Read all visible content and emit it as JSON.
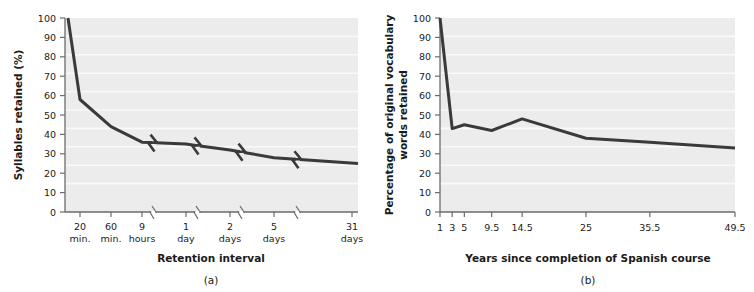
{
  "figure": {
    "background_color": "#ffffff",
    "plot_background_color": "#ececec",
    "gridline_color": "#f7f7f7",
    "line_color": "#3a3a3a",
    "axis_color": "#5a5a5a",
    "text_color": "#1a1a1a"
  },
  "panels": [
    {
      "id": "a",
      "caption": "(a)",
      "xlabel": "Retention interval",
      "ylabel": "Syllables retained (%)",
      "ytick_labels": [
        "0",
        "10",
        "20",
        "30",
        "40",
        "50",
        "60",
        "70",
        "80",
        "90",
        "100"
      ],
      "xtick_labels": [
        {
          "line1": "20",
          "line2": "min."
        },
        {
          "line1": "60",
          "line2": "min."
        },
        {
          "line1": "9",
          "line2": "hours"
        },
        {
          "line1": "1",
          "line2": "day"
        },
        {
          "line1": "2",
          "line2": "days"
        },
        {
          "line1": "5",
          "line2": "days"
        },
        {
          "line1": "31",
          "line2": "days"
        }
      ]
    },
    {
      "id": "b",
      "caption": "(b)",
      "xlabel": "Years since completion of Spanish course",
      "ylabel_line1": "Percentage of original vocabulary",
      "ylabel_line2": "words retained",
      "ytick_labels": [
        "0",
        "10",
        "20",
        "30",
        "40",
        "50",
        "60",
        "70",
        "80",
        "90",
        "100"
      ],
      "xtick_labels": [
        "1",
        "3",
        "5",
        "9.5",
        "14.5",
        "25",
        "35.5",
        "49.5"
      ]
    }
  ],
  "chart_data": [
    {
      "type": "line",
      "panel": "a",
      "title": "",
      "xlabel": "Retention interval",
      "ylabel": "Syllables retained (%)",
      "ylim": [
        0,
        100
      ],
      "ytick_values": [
        0,
        10,
        20,
        30,
        40,
        50,
        60,
        70,
        80,
        90,
        100
      ],
      "grid": true,
      "legend": "none",
      "x_is_categorical_with_breaks": true,
      "axis_breaks_after_categories": [
        "9 hours",
        "1 day",
        "2 days",
        "5 days"
      ],
      "categories": [
        "0 min.",
        "20 min.",
        "60 min.",
        "9 hours",
        "1 day",
        "2 days",
        "5 days",
        "31 days"
      ],
      "values": [
        100,
        58,
        44,
        36,
        35,
        32,
        28,
        25
      ],
      "annotations": "Ebbinghaus forgetting curve for nonsense syllables; axis and data line contain zig-zag break marks between time segments."
    },
    {
      "type": "line",
      "panel": "b",
      "title": "",
      "xlabel": "Years since completion of Spanish course",
      "ylabel": "Percentage of original vocabulary words retained",
      "ylim": [
        0,
        100
      ],
      "ytick_values": [
        0,
        10,
        20,
        30,
        40,
        50,
        60,
        70,
        80,
        90,
        100
      ],
      "grid": true,
      "legend": "none",
      "x": [
        1,
        3,
        5,
        9.5,
        14.5,
        25,
        35.5,
        49.5
      ],
      "xtick_labels": [
        "1",
        "3",
        "5",
        "9.5",
        "14.5",
        "25",
        "35.5",
        "49.5"
      ],
      "values": [
        100,
        43,
        45,
        42,
        48,
        38,
        36,
        33
      ],
      "annotations": "Bahrick retention of Spanish vocabulary; sharp drop in first 3 years then long plateau."
    }
  ]
}
